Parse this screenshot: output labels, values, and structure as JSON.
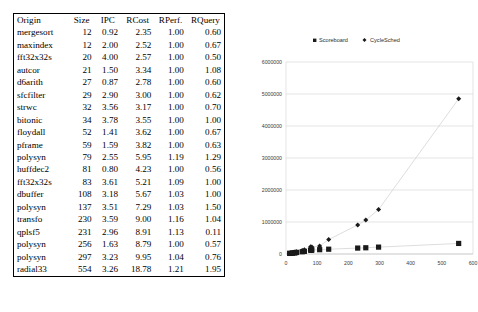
{
  "table": {
    "columns": [
      "Origin",
      "Size",
      "IPC",
      "RCost",
      "RPerf.",
      "RQuery"
    ],
    "rows": [
      {
        "origin": "mergesort",
        "size": "12",
        "ipc": "0.92",
        "rcost": "2.35",
        "rperf": "1.00",
        "rquery": "0.60"
      },
      {
        "origin": "maxindex",
        "size": "12",
        "ipc": "2.00",
        "rcost": "2.52",
        "rperf": "1.00",
        "rquery": "0.67"
      },
      {
        "origin": "fft32x32s",
        "size": "20",
        "ipc": "4.00",
        "rcost": "2.57",
        "rperf": "1.00",
        "rquery": "0.50"
      },
      {
        "origin": "autcor",
        "size": "21",
        "ipc": "1.50",
        "rcost": "3.34",
        "rperf": "1.00",
        "rquery": "1.08"
      },
      {
        "origin": "d6arith",
        "size": "27",
        "ipc": "0.87",
        "rcost": "2.78",
        "rperf": "1.00",
        "rquery": "0.60"
      },
      {
        "origin": "sfcfilter",
        "size": "29",
        "ipc": "2.90",
        "rcost": "3.00",
        "rperf": "1.00",
        "rquery": "0.62"
      },
      {
        "origin": "strwc",
        "size": "32",
        "ipc": "3.56",
        "rcost": "3.17",
        "rperf": "1.00",
        "rquery": "0.70"
      },
      {
        "origin": "bitonic",
        "size": "34",
        "ipc": "3.78",
        "rcost": "3.55",
        "rperf": "1.00",
        "rquery": "1.00"
      },
      {
        "origin": "floydall",
        "size": "52",
        "ipc": "1.41",
        "rcost": "3.62",
        "rperf": "1.00",
        "rquery": "0.67"
      },
      {
        "origin": "pframe",
        "size": "59",
        "ipc": "1.59",
        "rcost": "3.82",
        "rperf": "1.00",
        "rquery": "0.63"
      },
      {
        "origin": "polysyn",
        "size": "79",
        "ipc": "2.55",
        "rcost": "5.95",
        "rperf": "1.19",
        "rquery": "1.29"
      },
      {
        "origin": "huffdec2",
        "size": "81",
        "ipc": "0.80",
        "rcost": "4.23",
        "rperf": "1.00",
        "rquery": "0.56"
      },
      {
        "origin": "fft32x32s",
        "size": "83",
        "ipc": "3.61",
        "rcost": "5.21",
        "rperf": "1.09",
        "rquery": "1.00"
      },
      {
        "origin": "dbuffer",
        "size": "108",
        "ipc": "3.18",
        "rcost": "5.67",
        "rperf": "1.03",
        "rquery": "1.00"
      },
      {
        "origin": "polysyn",
        "size": "137",
        "ipc": "3.51",
        "rcost": "7.29",
        "rperf": "1.03",
        "rquery": "1.50"
      },
      {
        "origin": "transfo",
        "size": "230",
        "ipc": "3.59",
        "rcost": "9.00",
        "rperf": "1.16",
        "rquery": "1.04"
      },
      {
        "origin": "qplsf5",
        "size": "231",
        "ipc": "2.96",
        "rcost": "8.91",
        "rperf": "1.13",
        "rquery": "0.11"
      },
      {
        "origin": "polysyn",
        "size": "256",
        "ipc": "1.63",
        "rcost": "8.79",
        "rperf": "1.00",
        "rquery": "0.57"
      },
      {
        "origin": "polysyn",
        "size": "297",
        "ipc": "3.23",
        "rcost": "9.95",
        "rperf": "1.04",
        "rquery": "0.76"
      },
      {
        "origin": "radial33",
        "size": "554",
        "ipc": "3.26",
        "rcost": "18.78",
        "rperf": "1.21",
        "rquery": "1.95"
      }
    ]
  },
  "chart_data": {
    "type": "scatter",
    "title": "",
    "xlabel": "",
    "ylabel": "",
    "xlim": [
      0,
      600
    ],
    "ylim": [
      0,
      6000000
    ],
    "xticks": [
      0,
      100,
      200,
      300,
      400,
      500,
      600
    ],
    "yticks": [
      0,
      1000000,
      2000000,
      3000000,
      4000000,
      5000000,
      6000000
    ],
    "xticklabels": [
      "0",
      "100",
      "200",
      "300",
      "400",
      "500",
      "600"
    ],
    "yticklabels": [
      "0",
      "1000000",
      "2000000",
      "3000000",
      "4000000",
      "5000000",
      "6000000"
    ],
    "grid": true,
    "legend_position": "top",
    "series": [
      {
        "name": "Scoreboard",
        "marker": "square",
        "color": "#1a1a1a",
        "points": [
          {
            "x": 12,
            "y": 18000
          },
          {
            "x": 12,
            "y": 20000
          },
          {
            "x": 20,
            "y": 26000
          },
          {
            "x": 21,
            "y": 30000
          },
          {
            "x": 27,
            "y": 36000
          },
          {
            "x": 29,
            "y": 40000
          },
          {
            "x": 32,
            "y": 46000
          },
          {
            "x": 34,
            "y": 50000
          },
          {
            "x": 52,
            "y": 70000
          },
          {
            "x": 59,
            "y": 82000
          },
          {
            "x": 79,
            "y": 120000
          },
          {
            "x": 81,
            "y": 115000
          },
          {
            "x": 83,
            "y": 125000
          },
          {
            "x": 108,
            "y": 135000
          },
          {
            "x": 137,
            "y": 150000
          },
          {
            "x": 230,
            "y": 185000
          },
          {
            "x": 256,
            "y": 195000
          },
          {
            "x": 297,
            "y": 215000
          },
          {
            "x": 554,
            "y": 330000
          }
        ]
      },
      {
        "name": "CycleSched",
        "marker": "diamond",
        "color": "#1a1a1a",
        "points": [
          {
            "x": 12,
            "y": 20000
          },
          {
            "x": 20,
            "y": 32000
          },
          {
            "x": 27,
            "y": 45000
          },
          {
            "x": 32,
            "y": 60000
          },
          {
            "x": 34,
            "y": 68000
          },
          {
            "x": 52,
            "y": 110000
          },
          {
            "x": 59,
            "y": 130000
          },
          {
            "x": 79,
            "y": 230000
          },
          {
            "x": 83,
            "y": 215000
          },
          {
            "x": 108,
            "y": 250000
          },
          {
            "x": 137,
            "y": 450000
          },
          {
            "x": 230,
            "y": 910000
          },
          {
            "x": 256,
            "y": 1060000
          },
          {
            "x": 297,
            "y": 1390000
          },
          {
            "x": 554,
            "y": 4850000
          }
        ]
      }
    ]
  }
}
